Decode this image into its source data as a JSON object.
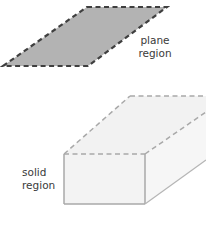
{
  "labels": {
    "plane": [
      "plane",
      "region"
    ],
    "solid": [
      "solid",
      "region"
    ]
  },
  "colors": {
    "plane_fill": "#b3b3b3",
    "plane_stroke": "#3f3f3f",
    "solid_fill": "#f3f3f3",
    "solid_stroke": "#a9a9a9"
  }
}
